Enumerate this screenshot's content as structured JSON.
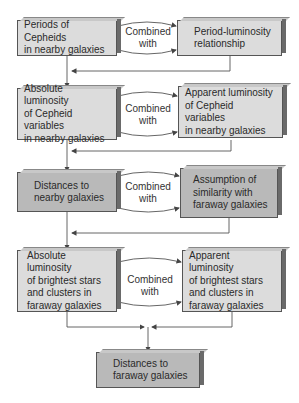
{
  "diagram": {
    "connector_label": "Combined\nwith",
    "rows": [
      {
        "left": {
          "text": "Periods of Cepheids\nin nearby galaxies",
          "shade": "light"
        },
        "right": {
          "text": "Period-luminosity\nrelationship",
          "shade": "light"
        }
      },
      {
        "left": {
          "text": "Absolute luminosity\nof Cepheid variables\nin nearby galaxies",
          "shade": "light"
        },
        "right": {
          "text": "Apparent luminosity\nof Cepheid variables\nin nearby galaxies",
          "shade": "light"
        }
      },
      {
        "left": {
          "text": "Distances to\nnearby galaxies",
          "shade": "dark"
        },
        "right": {
          "text": "Assumption of\nsimilarity with\nfaraway galaxies",
          "shade": "dark"
        }
      },
      {
        "left": {
          "text": "Absolute luminosity\nof brightest stars\nand clusters in\nfaraway galaxies",
          "shade": "light"
        },
        "right": {
          "text": "Apparent luminosity\nof brightest stars\nand clusters in\nfaraway galaxies",
          "shade": "light"
        }
      }
    ],
    "final": {
      "text": "Distances to\nfaraway galaxies",
      "shade": "dark"
    }
  }
}
